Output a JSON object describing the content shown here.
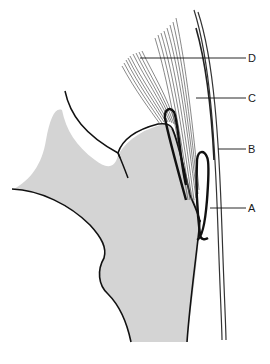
{
  "diagram": {
    "type": "anatomical line drawing",
    "colors": {
      "bone_fill": "#d4d4d4",
      "outline": "#111111",
      "fibers": "#444444",
      "background": "#ffffff"
    },
    "labels": [
      {
        "id": "A",
        "text": "A"
      },
      {
        "id": "B",
        "text": "B"
      },
      {
        "id": "C",
        "text": "C"
      },
      {
        "id": "D",
        "text": "D"
      }
    ]
  }
}
